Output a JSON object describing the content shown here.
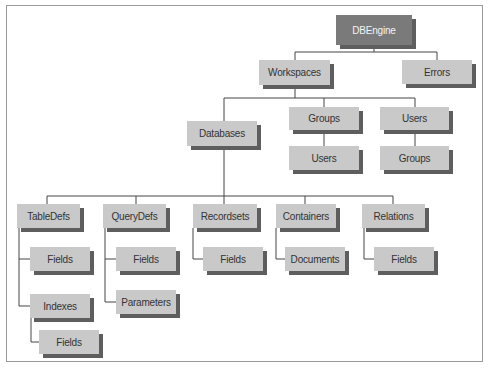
{
  "diagram": {
    "type": "hierarchy",
    "nodes": {
      "dbengine": "DBEngine",
      "workspaces": "Workspaces",
      "errors": "Errors",
      "databases": "Databases",
      "groups": "Groups",
      "groups_users": "Users",
      "users": "Users",
      "users_groups": "Groups",
      "tabledefs": "TableDefs",
      "tabledefs_fields": "Fields",
      "indexes": "Indexes",
      "indexes_fields": "Fields",
      "querydefs": "QueryDefs",
      "querydefs_fields": "Fields",
      "parameters": "Parameters",
      "recordsets": "Recordsets",
      "recordsets_fields": "Fields",
      "containers": "Containers",
      "documents": "Documents",
      "relations": "Relations",
      "relations_fields": "Fields"
    },
    "edges": [
      [
        "DBEngine",
        "Workspaces"
      ],
      [
        "DBEngine",
        "Errors"
      ],
      [
        "Workspaces",
        "Databases"
      ],
      [
        "Workspaces",
        "Groups"
      ],
      [
        "Workspaces",
        "Users"
      ],
      [
        "Groups",
        "Users"
      ],
      [
        "Users",
        "Groups"
      ],
      [
        "Databases",
        "TableDefs"
      ],
      [
        "Databases",
        "QueryDefs"
      ],
      [
        "Databases",
        "Recordsets"
      ],
      [
        "Databases",
        "Containers"
      ],
      [
        "Databases",
        "Relations"
      ],
      [
        "TableDefs",
        "Fields"
      ],
      [
        "TableDefs",
        "Indexes"
      ],
      [
        "Indexes",
        "Fields"
      ],
      [
        "QueryDefs",
        "Fields"
      ],
      [
        "QueryDefs",
        "Parameters"
      ],
      [
        "Recordsets",
        "Fields"
      ],
      [
        "Containers",
        "Documents"
      ],
      [
        "Relations",
        "Fields"
      ]
    ],
    "colors": {
      "root_fill": "#7a7a7a",
      "node_fill": "#c9c9c9",
      "shadow": "#5e5e5e",
      "line": "#444444"
    }
  }
}
